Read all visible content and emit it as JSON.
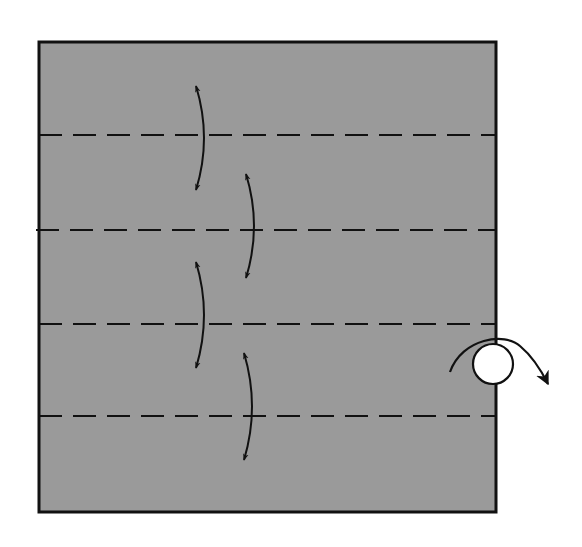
{
  "diagram": {
    "colors": {
      "paper": "#9a9a9a",
      "ink": "#111111",
      "background": "#ffffff",
      "circle_fill": "#ffffff"
    },
    "paper": {
      "x": 39,
      "y": 42,
      "width": 457,
      "height": 470,
      "stroke_width": 3
    },
    "fold_lines": [
      {
        "type": "valley",
        "y": 135,
        "x1": 39,
        "x2": 496
      },
      {
        "type": "valley",
        "y": 230,
        "x1": 36,
        "x2": 496
      },
      {
        "type": "valley",
        "y": 324,
        "x1": 39,
        "x2": 496
      },
      {
        "type": "valley",
        "y": 416,
        "x1": 39,
        "x2": 496
      }
    ],
    "fold_arrows": [
      {
        "name": "fold-arrow-1",
        "x": 200,
        "y1": 86,
        "y2": 190,
        "bulge": 6
      },
      {
        "name": "fold-arrow-2",
        "x": 250,
        "y1": 174,
        "y2": 278,
        "bulge": 6
      },
      {
        "name": "fold-arrow-3",
        "x": 200,
        "y1": 262,
        "y2": 368,
        "bulge": 6
      },
      {
        "name": "fold-arrow-4",
        "x": 248,
        "y1": 353,
        "y2": 460,
        "bulge": 6
      }
    ],
    "turn_over": {
      "symbol": "turn-over",
      "circle_cx": 493,
      "circle_cy": 364,
      "circle_r": 20
    }
  }
}
